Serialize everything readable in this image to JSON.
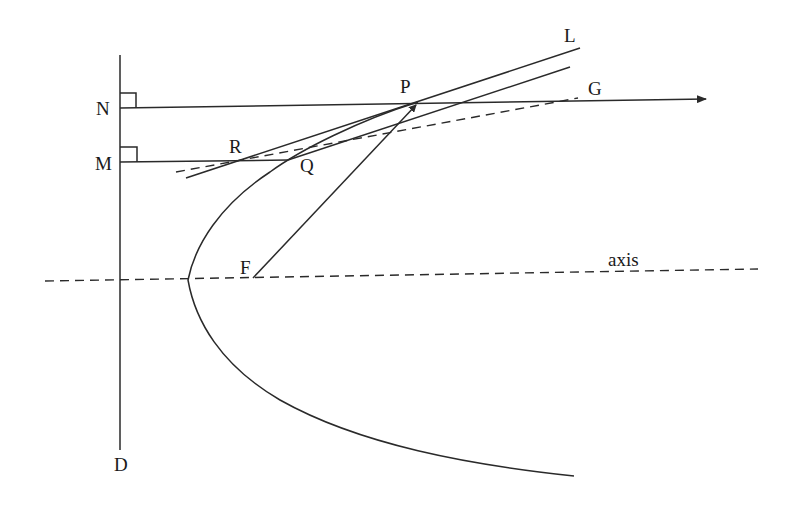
{
  "diagram": {
    "labels": {
      "N": "N",
      "M": "M",
      "P": "P",
      "L": "L",
      "G": "G",
      "R": "R",
      "Q": "Q",
      "F": "F",
      "D": "D",
      "axis": "axis"
    },
    "points": {
      "N": [
        120,
        108
      ],
      "M": [
        120,
        162
      ],
      "P": [
        418,
        102
      ],
      "G": [
        578,
        98
      ],
      "L": [
        580,
        48
      ],
      "R": [
        236,
        160
      ],
      "Q": [
        288,
        160
      ],
      "F": [
        253,
        278
      ],
      "vertex": [
        188,
        280
      ],
      "D": [
        120,
        450
      ]
    },
    "colors": {
      "stroke": "#2a2a2a",
      "text": "#1a1a1a",
      "background": "#ffffff"
    }
  }
}
